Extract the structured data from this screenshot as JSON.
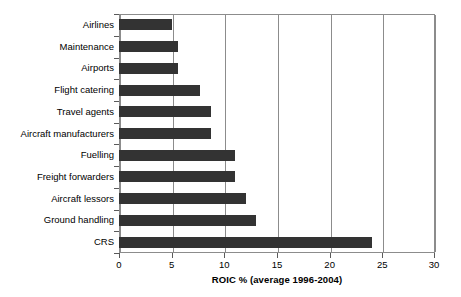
{
  "chart_data": {
    "type": "bar",
    "orientation": "horizontal",
    "title": "",
    "xlabel": "ROIC % (average 1996-2004)",
    "ylabel": "",
    "xlim": [
      0,
      30
    ],
    "xticks": [
      0,
      5,
      10,
      15,
      20,
      25,
      30
    ],
    "xtick_labels": [
      "0",
      "5",
      "10",
      "15",
      "20",
      "25",
      "30"
    ],
    "grid": "vertical",
    "legend": "none",
    "bar_color": "#333333",
    "frame_color": "#8c8c8c",
    "categories": [
      "Airlines",
      "Maintenance",
      "Airports",
      "Flight catering",
      "Travel agents",
      "Aircraft manufacturers",
      "Fuelling",
      "Freight forwarders",
      "Aircraft lessors",
      "Ground handling",
      "CRS"
    ],
    "values": [
      5.0,
      5.6,
      5.6,
      7.7,
      8.7,
      8.7,
      11.0,
      11.0,
      12.1,
      13.0,
      24.0
    ]
  }
}
